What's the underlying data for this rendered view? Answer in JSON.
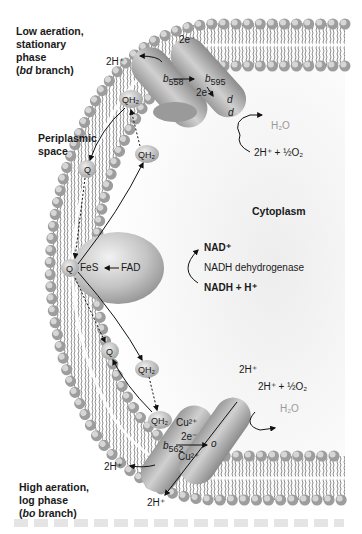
{
  "diagram": {
    "regions": {
      "periplasm": "Periplasmic space",
      "cytoplasm": "Cytoplasm"
    },
    "top_branch": {
      "heading_line1": "Low aeration,",
      "heading_line2": "stationary",
      "heading_line3": "phase",
      "heading_line4_italic": "bd",
      "heading_line4_rest": " branch)",
      "heading_line4_open": "(",
      "proton_out": "2H⁺",
      "electrons_top": "2e⁻",
      "electrons_mid": "2e⁻",
      "cyt_b558": "b",
      "cyt_b558_sub": "558",
      "cyt_b595": "b",
      "cyt_b595_sub": "595",
      "cyt_d1": "d",
      "cyt_d2": "d",
      "product": "H₂O",
      "reactant": "2H⁺ + ½O₂"
    },
    "dehydrogenase": {
      "name": "NADH dehydrogenase",
      "fes": "FeS",
      "fad": "FAD",
      "product": "NAD⁺",
      "substrate": "NADH + H⁺"
    },
    "quinones": {
      "q": "Q",
      "qh2": "QH₂"
    },
    "bottom_branch": {
      "heading_line1": "High aeration,",
      "heading_line2": "log phase",
      "heading_line3_open": "(",
      "heading_line3_italic": "bo",
      "heading_line3_rest": " branch)",
      "proton_in_top": "2H⁺",
      "reactant": "2H⁺ + ½O₂",
      "product": "H₂O",
      "cu_top": "Cu²⁺",
      "cu_bottom": "Cu²⁺",
      "electrons": "2e⁻",
      "cyt_b562": "b",
      "cyt_b562_sub": "562",
      "cyt_o": "o",
      "proton_out_left": "2H⁺",
      "proton_out_bottom": "2H⁺"
    },
    "colors": {
      "membrane_head": "#a9a9a9",
      "protein": "#b5b5b5",
      "background_shade": "#e6e6e6",
      "grey_text": "#9a9a9a"
    }
  }
}
